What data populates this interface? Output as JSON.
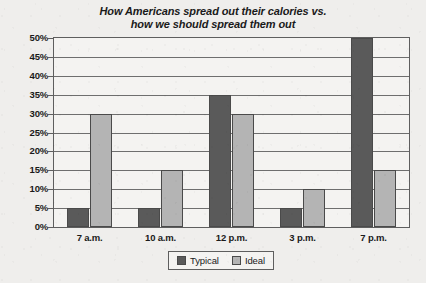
{
  "chart_data": {
    "type": "bar",
    "title": "How Americans spread out their calories vs. how we should spread them out",
    "title_lines": [
      "How Americans spread out their calories vs.",
      "how we should spread them out"
    ],
    "xlabel": "",
    "ylabel": "",
    "ylim": [
      0,
      50
    ],
    "ytick_step": 5,
    "ytick_labels": [
      "50%",
      "45%",
      "40%",
      "35%",
      "30%",
      "25%",
      "20%",
      "15%",
      "10%",
      "5%",
      "0%"
    ],
    "ytick_values": [
      50,
      45,
      40,
      35,
      30,
      25,
      20,
      15,
      10,
      5,
      0
    ],
    "grid": true,
    "grid_axis": "y",
    "legend_position": "bottom-center",
    "categories": [
      "7 a.m.",
      "10 a.m.",
      "12 p.m.",
      "3 p.m.",
      "7 p.m."
    ],
    "series": [
      {
        "name": "Typical",
        "color": "#5a5a5a",
        "values": [
          5,
          5,
          35,
          5,
          50
        ]
      },
      {
        "name": "Ideal",
        "color": "#b4b4b4",
        "values": [
          30,
          15,
          30,
          10,
          15
        ]
      }
    ]
  },
  "legend": {
    "entries": [
      {
        "label": "Typical"
      },
      {
        "label": "Ideal"
      }
    ]
  },
  "colors": {
    "typical": "#5a5a5a",
    "ideal": "#b4b4b4",
    "page_background": "#efeeec",
    "plot_background": "#f4f3f1",
    "axis": "#5e5e5e",
    "gridline": "#6e6e6e",
    "text": "#1a1a1a"
  }
}
